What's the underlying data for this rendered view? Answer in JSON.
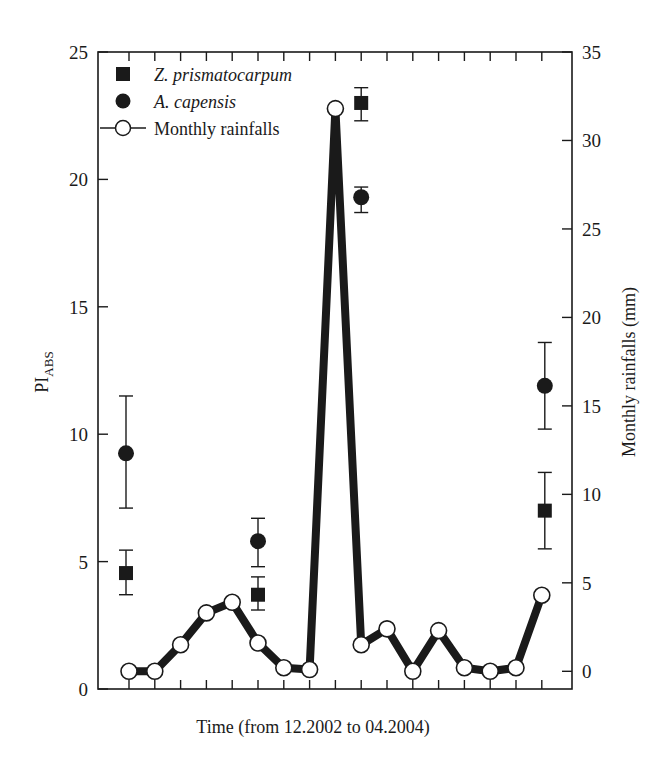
{
  "chart_data": {
    "type": "line",
    "title": "",
    "xlabel": "Time (from 12.2002 to 04.2004)",
    "ylabel": "PI",
    "ylabel_subscript": "ABS",
    "y2label": "Monthly rainfalls (mm)",
    "ylim": [
      0,
      25
    ],
    "y2lim": [
      -1,
      35
    ],
    "yticks": [
      0,
      5,
      10,
      15,
      20,
      25
    ],
    "y2ticks": [
      0,
      5,
      10,
      15,
      20,
      25,
      30,
      35
    ],
    "x_tick_count": 17,
    "grid": false,
    "legend_position": "upper left",
    "legend": [
      {
        "label": "Z. prismatocarpum",
        "marker": "filled-square",
        "italic": true
      },
      {
        "label": "A. capensis",
        "marker": "filled-circle",
        "italic": true
      },
      {
        "label": "Monthly rainfalls",
        "marker": "open-circle-line",
        "italic": false
      }
    ],
    "x": [
      0,
      1,
      2,
      3,
      4,
      5,
      6,
      7,
      8,
      9,
      10,
      11,
      12,
      13,
      14,
      15,
      16
    ],
    "series": [
      {
        "name": "Monthly rainfalls",
        "axis": "right",
        "type": "line",
        "values": [
          0,
          0,
          1.5,
          3.3,
          3.9,
          1.6,
          0.2,
          0.1,
          31.8,
          1.5,
          2.4,
          0,
          2.3,
          0.2,
          0,
          0.2,
          4.3
        ]
      },
      {
        "name": "Z. prismatocarpum",
        "axis": "left",
        "type": "scatter",
        "points": [
          {
            "x": 0,
            "y": 4.55,
            "err_low": 3.7,
            "err_high": 5.45
          },
          {
            "x": 5,
            "y": 3.7,
            "err_low": 3.1,
            "err_high": 4.4
          },
          {
            "x": 9,
            "y": 23.0,
            "err_low": 22.3,
            "err_high": 23.6
          },
          {
            "x": 16,
            "y": 7.0,
            "err_low": 5.5,
            "err_high": 8.5
          }
        ]
      },
      {
        "name": "A. capensis",
        "axis": "left",
        "type": "scatter",
        "points": [
          {
            "x": 0,
            "y": 9.25,
            "err_low": 7.1,
            "err_high": 11.5
          },
          {
            "x": 5,
            "y": 5.8,
            "err_low": 4.8,
            "err_high": 6.7
          },
          {
            "x": 9,
            "y": 19.3,
            "err_low": 18.7,
            "err_high": 19.7
          },
          {
            "x": 16,
            "y": 11.9,
            "err_low": 10.2,
            "err_high": 13.6
          }
        ]
      }
    ]
  },
  "colors": {
    "ink": "#1a1a1a",
    "background": "#ffffff",
    "marker_fill_open": "#ffffff"
  }
}
